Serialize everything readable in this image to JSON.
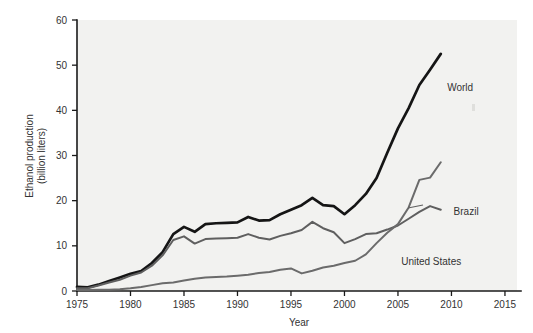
{
  "chart_data": {
    "type": "line",
    "title": "",
    "xlabel": "Year",
    "ylabel": "Ethanol production\n(billion liters)",
    "ylabel_line1": "Ethanol production",
    "ylabel_line2": "(billion liters)",
    "xlim": [
      1975,
      2016.5
    ],
    "ylim": [
      0,
      60
    ],
    "xticks": [
      1975,
      1980,
      1985,
      1990,
      1995,
      2000,
      2005,
      2010,
      2015
    ],
    "yticks": [
      0,
      10,
      20,
      30,
      40,
      50,
      60
    ],
    "grid": false,
    "legend_position": "inline-labels",
    "series": [
      {
        "name": "World",
        "color": "#151515",
        "label": "World",
        "x": [
          1975,
          1976,
          1977,
          1978,
          1979,
          1980,
          1981,
          1982,
          1983,
          1984,
          1985,
          1986,
          1987,
          1988,
          1989,
          1990,
          1991,
          1992,
          1993,
          1994,
          1995,
          1996,
          1997,
          1998,
          1999,
          2000,
          2001,
          2002,
          2003,
          2004,
          2005,
          2006,
          2007,
          2008,
          2009
        ],
        "values": [
          0.9,
          0.8,
          1.4,
          2.2,
          3.0,
          3.8,
          4.4,
          6.2,
          8.6,
          12.6,
          14.2,
          13.1,
          14.8,
          15.0,
          15.1,
          15.2,
          16.4,
          15.6,
          15.7,
          17.0,
          18.0,
          19.0,
          20.6,
          19.0,
          18.8,
          17.0,
          19.0,
          21.5,
          25.0,
          30.6,
          36.0,
          40.5,
          45.6,
          49.0,
          52.5
        ]
      },
      {
        "name": "Brazil",
        "color": "#5f5f5f",
        "label": "Brazil",
        "x": [
          1975,
          1976,
          1977,
          1978,
          1979,
          1980,
          1981,
          1982,
          1983,
          1984,
          1985,
          1986,
          1987,
          1988,
          1989,
          1990,
          1991,
          1992,
          1993,
          1994,
          1995,
          1996,
          1997,
          1998,
          1999,
          2000,
          2001,
          2002,
          2003,
          2004,
          2005,
          2006,
          2007,
          2008,
          2009
        ],
        "values": [
          0.6,
          0.6,
          1.2,
          1.9,
          2.5,
          3.4,
          4.1,
          5.6,
          7.9,
          11.3,
          12.1,
          10.5,
          11.5,
          11.6,
          11.7,
          11.8,
          12.6,
          11.8,
          11.4,
          12.2,
          12.8,
          13.5,
          15.3,
          13.9,
          13.0,
          10.6,
          11.5,
          12.6,
          12.8,
          13.6,
          14.5,
          16.0,
          17.5,
          18.8,
          18.0
        ]
      },
      {
        "name": "United States",
        "color": "#6b6b6b",
        "label": "United States",
        "x": [
          1975,
          1976,
          1977,
          1978,
          1979,
          1980,
          1981,
          1982,
          1983,
          1984,
          1985,
          1986,
          1987,
          1988,
          1989,
          1990,
          1991,
          1992,
          1993,
          1994,
          1995,
          1996,
          1997,
          1998,
          1999,
          2000,
          2001,
          2002,
          2003,
          2004,
          2005,
          2006,
          2007,
          2008,
          2009
        ],
        "values": [
          0.2,
          0.2,
          0.3,
          0.3,
          0.4,
          0.6,
          0.9,
          1.3,
          1.7,
          1.9,
          2.3,
          2.7,
          3.0,
          3.1,
          3.2,
          3.4,
          3.6,
          4.0,
          4.2,
          4.7,
          5.0,
          3.9,
          4.5,
          5.2,
          5.6,
          6.2,
          6.7,
          8.1,
          10.6,
          12.9,
          14.8,
          18.5,
          24.6,
          25.1,
          28.5
        ]
      }
    ],
    "annotations": [
      {
        "text": "World",
        "x": 2009.6,
        "y": 45.0
      },
      {
        "text": "Brazil",
        "x": 2010.2,
        "y": 17.5
      },
      {
        "text": "United States",
        "x": 2005.3,
        "y": 6.5
      }
    ]
  },
  "colors": {
    "plot_background": "#f2f2f0",
    "page_background": "#ffffff",
    "axis": "#1a1a1a",
    "text": "#333333"
  }
}
